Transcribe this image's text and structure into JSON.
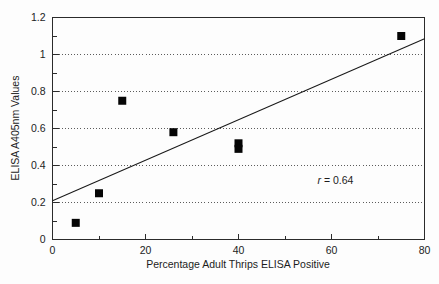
{
  "chart_data": {
    "type": "scatter",
    "title": "",
    "xlabel": "Percentage Adult Thrips ELISA Positive",
    "ylabel": "ELISA A405nm Values",
    "xlim": [
      0,
      80
    ],
    "ylim": [
      0,
      1.2
    ],
    "grid": "horizontal-dotted",
    "legend": "none",
    "x_ticks": [
      0,
      20,
      40,
      60,
      80
    ],
    "x_tick_labels": [
      "0",
      "20",
      "40",
      "60",
      "80"
    ],
    "x_minor_ticks": [
      10,
      30,
      50,
      70
    ],
    "y_ticks": [
      0,
      0.2,
      0.4,
      0.6,
      0.8,
      1,
      1.2
    ],
    "y_tick_labels": [
      "0",
      "0.2",
      "0.4",
      "0.6",
      "0.8",
      "1",
      "1.2"
    ],
    "y_minor_ticks": [
      0.1,
      0.3,
      0.5,
      0.7,
      0.9,
      1.1
    ],
    "gridline_values": [
      0.2,
      0.4,
      0.6,
      0.8,
      1
    ],
    "points": [
      {
        "x": 5,
        "y": 0.09
      },
      {
        "x": 10,
        "y": 0.25
      },
      {
        "x": 15,
        "y": 0.75
      },
      {
        "x": 26,
        "y": 0.58
      },
      {
        "x": 40,
        "y": 0.52
      },
      {
        "x": 40,
        "y": 0.49
      },
      {
        "x": 75,
        "y": 1.1
      }
    ],
    "fit_line": {
      "x_start": 0,
      "y_start": 0.21,
      "x_end": 80,
      "y_end": 1.085
    },
    "annotations": [
      {
        "name": "correlation",
        "symbol": "r",
        "operator": "=",
        "value": "0.64",
        "text": "r = 0.64",
        "x": 57,
        "y": 0.3
      }
    ]
  },
  "colors": {
    "marker": "#050505",
    "line": "#1a1a1a",
    "axis": "#2b2b2b",
    "grid": "#4a4a4a",
    "background": "#fdfdfd",
    "text": "#1c1c1c"
  }
}
